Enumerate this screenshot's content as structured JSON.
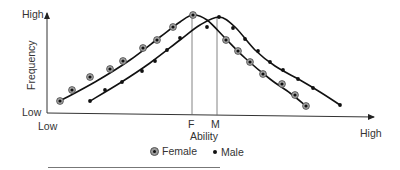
{
  "chart_data": {
    "type": "line",
    "title": "",
    "xlabel": "Ability",
    "ylabel": "Frequency",
    "x_tick_labels": {
      "left": "Low",
      "right": "High"
    },
    "y_tick_labels": {
      "bottom": "Low",
      "top": "High"
    },
    "markers": [
      {
        "label": "F",
        "meaning": "Female mean ability",
        "x_px": 192
      },
      {
        "label": "M",
        "meaning": "Male mean ability",
        "x_px": 217
      }
    ],
    "legend": [
      {
        "name": "Female",
        "marker": "circled-dot"
      },
      {
        "name": "Male",
        "marker": "dot"
      }
    ],
    "legend_position": "bottom-center",
    "grid": false,
    "series": [
      {
        "name": "Female",
        "marker": "circled-dot",
        "points_px": [
          [
            60,
            101
          ],
          [
            72,
            90
          ],
          [
            90,
            77
          ],
          [
            110,
            69
          ],
          [
            123,
            61
          ],
          [
            143,
            48
          ],
          [
            157,
            40
          ],
          [
            173,
            27
          ],
          [
            193,
            15
          ],
          [
            226,
            40
          ],
          [
            238,
            51
          ],
          [
            250,
            62
          ],
          [
            263,
            74
          ],
          [
            282,
            84
          ],
          [
            295,
            95
          ],
          [
            306,
            106
          ]
        ],
        "curve_px": [
          [
            60,
            101
          ],
          [
            95,
            82
          ],
          [
            130,
            60
          ],
          [
            160,
            37
          ],
          [
            180,
            22
          ],
          [
            193,
            15
          ],
          [
            207,
            20
          ],
          [
            225,
            38
          ],
          [
            245,
            58
          ],
          [
            270,
            79
          ],
          [
            290,
            93
          ],
          [
            306,
            106
          ]
        ]
      },
      {
        "name": "Male",
        "marker": "dot",
        "points_px": [
          [
            90,
            101
          ],
          [
            105,
            90
          ],
          [
            122,
            82
          ],
          [
            142,
            71
          ],
          [
            155,
            61
          ],
          [
            167,
            50
          ],
          [
            180,
            38
          ],
          [
            207,
            27
          ],
          [
            219,
            17
          ],
          [
            233,
            28
          ],
          [
            245,
            39
          ],
          [
            258,
            51
          ],
          [
            270,
            62
          ],
          [
            283,
            70
          ],
          [
            298,
            79
          ],
          [
            313,
            88
          ],
          [
            340,
            105
          ]
        ],
        "curve_px": [
          [
            90,
            101
          ],
          [
            120,
            83
          ],
          [
            150,
            63
          ],
          [
            180,
            40
          ],
          [
            200,
            25
          ],
          [
            219,
            17
          ],
          [
            235,
            27
          ],
          [
            255,
            50
          ],
          [
            275,
            66
          ],
          [
            300,
            80
          ],
          [
            320,
            92
          ],
          [
            340,
            105
          ]
        ]
      }
    ]
  },
  "labels": {
    "y_high": "High",
    "y_low": "Low",
    "y_title": "Frequency",
    "x_low": "Low",
    "x_high": "High",
    "x_title": "Ability",
    "mark_f": "F",
    "mark_m": "M"
  },
  "legend": {
    "female": "Female",
    "male": "Male"
  }
}
